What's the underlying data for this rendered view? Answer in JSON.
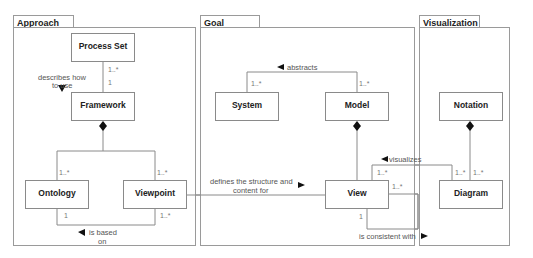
{
  "packages": [
    {
      "name": "Approach"
    },
    {
      "name": "Goal"
    },
    {
      "name": "Visualization"
    }
  ],
  "classes": {
    "process_set": "Process Set",
    "framework": "Framework",
    "ontology": "Ontology",
    "viewpoint": "Viewpoint",
    "system": "System",
    "model": "Model",
    "view": "View",
    "notation": "Notation",
    "diagram": "Diagram"
  },
  "associations": {
    "describes_how_to_use": {
      "label_line1": "describes how",
      "label_line2": "to use",
      "mult_process_set": "1..*",
      "mult_framework": "1"
    },
    "framework_composition": {
      "mult_ontology": "1..*",
      "mult_viewpoint": "1..*"
    },
    "is_based_on": {
      "label_line1": "is based",
      "label_line2": "on",
      "mult_ontology": "1",
      "mult_viewpoint": "1..*"
    },
    "abstracts": {
      "label": "abstracts",
      "mult_system": "1..*",
      "mult_model": "1..*"
    },
    "defines_structure": {
      "label_line1": "defines the structure and",
      "label_line2": "content for"
    },
    "visualizes": {
      "label": "visualizes",
      "mult_view": "1..*",
      "mult_diagram": "1..*"
    },
    "is_consistent_with": {
      "label": "is consistent with",
      "mult_top": "1..*",
      "mult_bottom": "1"
    },
    "notation_composition": {
      "mult_diagram": "1..*"
    }
  },
  "colors": {
    "line": "#8a8a8a",
    "border": "#9a9a9a",
    "text": "#222222",
    "label": "#555555"
  }
}
